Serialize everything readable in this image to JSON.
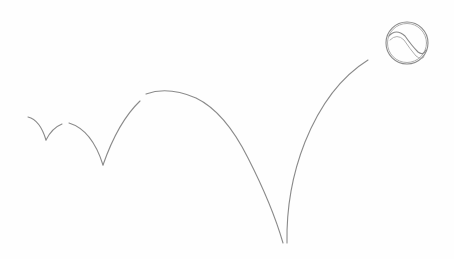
{
  "image": {
    "description": "Pencil sketch of a tennis ball bouncing, with its arcing trajectory drawn as lines",
    "subject": "tennis-ball",
    "style": "pencil-sketch",
    "background_color": "#fefefe",
    "stroke_color": "#8a8a8a"
  },
  "trajectory": {
    "bounce_points": [
      {
        "x": 46,
        "y": 140
      },
      {
        "x": 103,
        "y": 165
      },
      {
        "x": 285,
        "y": 243
      }
    ]
  },
  "ball": {
    "center_x": 407,
    "center_y": 43,
    "radius": 21
  }
}
